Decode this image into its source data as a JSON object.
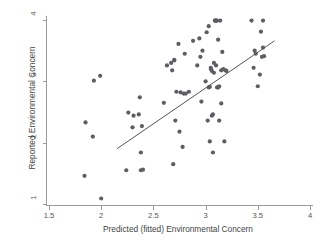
{
  "chart_data": {
    "type": "scatter",
    "title": "",
    "xlabel": "Predicted (fitted) Environmental Concern",
    "ylabel": "Reported Environmental Concern",
    "xlim": [
      1.5,
      4.0
    ],
    "ylim": [
      1.0,
      4.0
    ],
    "xticks": [
      1.5,
      2,
      2.5,
      3,
      3.5,
      4
    ],
    "xticklabels": [
      "1.5",
      "2",
      "2.5",
      "3",
      "3.5",
      "4"
    ],
    "yticks": [
      1,
      2,
      3,
      4
    ],
    "yticklabels": [
      "1",
      "2",
      "3",
      "4"
    ],
    "grid": false,
    "legend": "none",
    "point_color": "#5d5d63",
    "line_color": "#55555a",
    "axis_color": "#9a9a9a",
    "marker_radius_px": 2.1,
    "series": [
      {
        "name": "Observations",
        "x": [
          1.84,
          1.85,
          1.92,
          1.93,
          1.99,
          2.0,
          2.24,
          2.26,
          2.3,
          2.31,
          2.36,
          2.37,
          2.38,
          2.38,
          2.39,
          2.4,
          2.6,
          2.63,
          2.67,
          2.68,
          2.69,
          2.7,
          2.7,
          2.71,
          2.72,
          2.74,
          2.75,
          2.76,
          2.78,
          2.79,
          2.8,
          2.81,
          2.84,
          2.88,
          2.92,
          2.94,
          2.95,
          2.96,
          2.97,
          3.0,
          3.01,
          3.02,
          3.03,
          3.03,
          3.04,
          3.04,
          3.05,
          3.05,
          3.06,
          3.06,
          3.07,
          3.07,
          3.08,
          3.08,
          3.09,
          3.09,
          3.1,
          3.1,
          3.1,
          3.11,
          3.11,
          3.12,
          3.12,
          3.13,
          3.13,
          3.14,
          3.15,
          3.15,
          3.16,
          3.17,
          3.18,
          3.19,
          3.2,
          3.44,
          3.46,
          3.47,
          3.48,
          3.5,
          3.52,
          3.53,
          3.54,
          3.55,
          3.55,
          3.56
        ],
        "y": [
          1.46,
          2.33,
          2.1,
          3.01,
          3.09,
          1.09,
          1.55,
          2.49,
          2.25,
          2.44,
          2.46,
          2.74,
          1.84,
          1.55,
          2.27,
          1.56,
          2.65,
          3.26,
          3.3,
          3.18,
          1.65,
          3.35,
          3.34,
          2.36,
          2.83,
          3.61,
          2.18,
          2.82,
          1.93,
          2.8,
          3.45,
          2.8,
          2.83,
          3.66,
          3.26,
          3.7,
          3.4,
          2.67,
          3.5,
          3.0,
          3.8,
          2.36,
          3.9,
          2.9,
          2.91,
          2.02,
          3.2,
          3.22,
          3.17,
          2.44,
          1.84,
          2.46,
          3.3,
          3.14,
          3.99,
          3.99,
          3.99,
          3.99,
          3.26,
          3.99,
          2.9,
          3.68,
          2.9,
          2.36,
          2.92,
          3.99,
          2.64,
          3.18,
          3.48,
          3.2,
          2.02,
          3.18,
          3.17,
          3.99,
          3.22,
          3.5,
          3.45,
          2.92,
          3.11,
          3.81,
          3.4,
          3.99,
          3.55,
          3.41
        ]
      }
    ],
    "fit_line": {
      "type": "linear",
      "x_start": 2.15,
      "y_start": 1.9,
      "x_end": 3.66,
      "y_end": 3.66
    }
  },
  "figure": {
    "background": "#ffffff"
  }
}
